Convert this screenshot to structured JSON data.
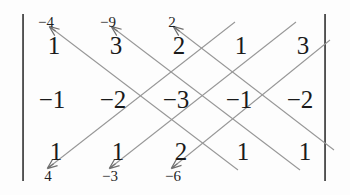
{
  "figure": {
    "kind": "determinant-diagram",
    "bracket_left": "|",
    "bracket_right": "|",
    "ink_color": "#1a1a1a",
    "line_color": "#8c8c8c",
    "background": "#fdfdfd"
  },
  "matrix": {
    "rows": 3,
    "cols": 5,
    "row1": [
      "1",
      "3",
      "2",
      "1",
      "3"
    ],
    "row2": [
      "−1",
      "−2",
      "−3",
      "−1",
      "−2"
    ],
    "row3": [
      "1",
      "1",
      "2",
      "1",
      "1"
    ]
  },
  "annotations": {
    "above_row1": [
      "−4",
      "−9",
      "2",
      "",
      ""
    ],
    "below_row3": [
      "4",
      "−3",
      "−6",
      "",
      ""
    ]
  },
  "arrows": {
    "up_left_count": 3,
    "down_left_count": 3,
    "description": "diagonal product lines with arrowheads pointing up-left on row 1 and down-left on row 3"
  }
}
